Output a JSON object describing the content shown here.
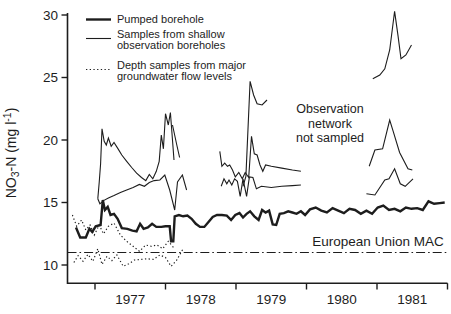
{
  "figure": {
    "background": "#ffffff",
    "ink_color": "#1d1d1d"
  },
  "legend": {
    "items": [
      {
        "style": "thick-solid",
        "label_lines": [
          "Pumped borehole"
        ]
      },
      {
        "style": "thin-solid",
        "label_lines": [
          "Samples from shallow",
          "observation boreholes"
        ]
      },
      {
        "style": "dotted",
        "label_lines": [
          "Depth samples from major",
          "groundwater flow levels"
        ]
      }
    ]
  },
  "chart_data": {
    "type": "line",
    "title": "",
    "xlabel": "",
    "ylabel": "NO3-N (mg l-1)",
    "ylabel_parts": {
      "base": "NO",
      "sub": "3",
      "mid": "-N  (mg l",
      "sup": "-1",
      "close": ")"
    },
    "grid": false,
    "legend_position": "top-left",
    "x_axis_range": [
      1976.6,
      1982.0
    ],
    "x_tick_years": [
      1977,
      1978,
      1979,
      1980,
      1981
    ],
    "ylim": [
      8.5,
      30.4
    ],
    "yticks": [
      10,
      15,
      20,
      25,
      30
    ],
    "annotations": {
      "observation_gap": {
        "lines": [
          "Observation",
          "network",
          "not sampled"
        ]
      },
      "mac": {
        "label": "European Union MAC",
        "value": 11.0
      }
    },
    "series": [
      {
        "name": "Pumped borehole",
        "style": "thick",
        "segments": [
          [
            [
              1976.73,
              13.0
            ],
            [
              1976.79,
              12.2
            ],
            [
              1976.87,
              12.2
            ],
            [
              1976.92,
              12.9
            ],
            [
              1976.96,
              12.65
            ],
            [
              1977.01,
              13.1
            ],
            [
              1977.08,
              13.2
            ],
            [
              1977.11,
              15.2
            ],
            [
              1977.14,
              14.4
            ],
            [
              1977.18,
              14.65
            ],
            [
              1977.22,
              14.0
            ],
            [
              1977.27,
              14.1
            ],
            [
              1977.32,
              13.7
            ],
            [
              1977.38,
              12.95
            ],
            [
              1977.46,
              12.9
            ],
            [
              1977.53,
              12.75
            ],
            [
              1977.59,
              12.7
            ],
            [
              1977.64,
              13.3
            ],
            [
              1977.69,
              12.9
            ],
            [
              1977.75,
              13.0
            ],
            [
              1977.81,
              13.3
            ],
            [
              1977.87,
              13.05
            ],
            [
              1977.94,
              13.05
            ],
            [
              1978.0,
              13.1
            ],
            [
              1978.06,
              13.1
            ],
            [
              1978.08,
              11.9
            ],
            [
              1978.11,
              11.9
            ],
            [
              1978.13,
              13.9
            ],
            [
              1978.19,
              14.0
            ],
            [
              1978.25,
              13.9
            ],
            [
              1978.31,
              13.95
            ],
            [
              1978.37,
              13.7
            ],
            [
              1978.43,
              13.3
            ],
            [
              1978.49,
              13.05
            ],
            [
              1978.55,
              13.05
            ],
            [
              1978.61,
              13.45
            ],
            [
              1978.67,
              13.85
            ],
            [
              1978.73,
              14.0
            ],
            [
              1978.8,
              14.0
            ],
            [
              1978.87,
              13.95
            ],
            [
              1978.93,
              13.6
            ],
            [
              1978.99,
              14.0
            ],
            [
              1979.05,
              14.15
            ],
            [
              1979.1,
              13.8
            ],
            [
              1979.15,
              14.1
            ],
            [
              1979.2,
              14.3
            ],
            [
              1979.26,
              13.9
            ],
            [
              1979.32,
              13.6
            ],
            [
              1979.37,
              14.4
            ],
            [
              1979.42,
              14.2
            ],
            [
              1979.47,
              14.35
            ],
            [
              1979.52,
              13.25
            ],
            [
              1979.57,
              13.2
            ],
            [
              1979.62,
              14.1
            ],
            [
              1979.68,
              14.15
            ],
            [
              1979.74,
              14.3
            ],
            [
              1979.8,
              14.2
            ],
            [
              1979.86,
              14.1
            ],
            [
              1979.92,
              14.3
            ],
            [
              1979.98,
              14.0
            ],
            [
              1980.05,
              14.45
            ],
            [
              1980.13,
              14.6
            ],
            [
              1980.21,
              14.35
            ],
            [
              1980.29,
              14.2
            ],
            [
              1980.37,
              14.55
            ],
            [
              1980.45,
              14.35
            ],
            [
              1980.53,
              14.15
            ],
            [
              1980.61,
              14.5
            ],
            [
              1980.69,
              14.4
            ],
            [
              1980.77,
              14.1
            ],
            [
              1980.85,
              14.35
            ],
            [
              1980.93,
              14.1
            ],
            [
              1981.01,
              14.6
            ],
            [
              1981.09,
              14.75
            ],
            [
              1981.17,
              14.4
            ],
            [
              1981.25,
              14.5
            ],
            [
              1981.33,
              14.3
            ],
            [
              1981.41,
              14.6
            ],
            [
              1981.49,
              14.5
            ],
            [
              1981.57,
              14.55
            ],
            [
              1981.65,
              14.4
            ],
            [
              1981.73,
              15.1
            ],
            [
              1981.81,
              14.9
            ],
            [
              1981.89,
              14.95
            ],
            [
              1981.96,
              15.0
            ]
          ]
        ]
      },
      {
        "name": "Samples from shallow observation boreholes",
        "style": "thin",
        "segments": [
          [
            [
              1977.04,
              15.3
            ],
            [
              1977.06,
              16.6
            ],
            [
              1977.08,
              18.1
            ],
            [
              1977.1,
              20.9
            ],
            [
              1977.13,
              19.9
            ],
            [
              1977.16,
              19.6
            ],
            [
              1977.19,
              20.15
            ],
            [
              1977.23,
              19.5
            ],
            [
              1977.27,
              19.8
            ],
            [
              1977.32,
              19.35
            ],
            [
              1977.38,
              18.8
            ],
            [
              1977.45,
              18.3
            ],
            [
              1977.52,
              17.8
            ],
            [
              1977.59,
              17.35
            ],
            [
              1977.66,
              17.0
            ],
            [
              1977.72,
              16.75
            ],
            [
              1977.77,
              17.25
            ],
            [
              1977.82,
              16.9
            ],
            [
              1977.87,
              17.5
            ],
            [
              1977.91,
              18.3
            ],
            [
              1977.94,
              20.4
            ],
            [
              1977.97,
              19.3
            ],
            [
              1978.0,
              22.1
            ],
            [
              1978.04,
              21.2
            ],
            [
              1978.07,
              22.2
            ],
            [
              1978.12,
              18.4
            ]
          ],
          [
            [
              1977.04,
              15.3
            ],
            [
              1977.07,
              14.9
            ],
            [
              1977.12,
              15.15
            ],
            [
              1977.19,
              15.35
            ],
            [
              1977.27,
              15.55
            ],
            [
              1977.36,
              15.8
            ],
            [
              1977.45,
              16.0
            ],
            [
              1977.54,
              16.2
            ],
            [
              1977.63,
              16.45
            ],
            [
              1977.7,
              16.3
            ],
            [
              1977.77,
              16.6
            ],
            [
              1977.84,
              16.75
            ],
            [
              1977.92,
              16.8
            ],
            [
              1977.99,
              17.2
            ],
            [
              1978.06,
              16.0
            ],
            [
              1978.13,
              14.4
            ],
            [
              1978.17,
              16.65
            ],
            [
              1978.24,
              17.2
            ],
            [
              1978.3,
              16.0
            ]
          ],
          [
            [
              1978.1,
              21.2
            ],
            [
              1978.16,
              19.6
            ],
            [
              1978.2,
              18.6
            ]
          ],
          [
            [
              1979.1,
              16.3
            ],
            [
              1979.14,
              17.1
            ],
            [
              1979.2,
              24.7
            ],
            [
              1979.25,
              23.6
            ],
            [
              1979.3,
              22.9
            ],
            [
              1979.37,
              22.8
            ],
            [
              1979.44,
              23.2
            ]
          ],
          [
            [
              1978.77,
              19.1
            ],
            [
              1978.8,
              17.9
            ],
            [
              1978.84,
              18.15
            ],
            [
              1978.88,
              17.9
            ],
            [
              1978.91,
              18.0
            ],
            [
              1978.95,
              17.6
            ],
            [
              1978.99,
              17.05
            ],
            [
              1979.04,
              17.4
            ],
            [
              1979.09,
              16.9
            ],
            [
              1979.13,
              17.4
            ],
            [
              1979.18,
              17.0
            ],
            [
              1979.22,
              20.3
            ],
            [
              1979.26,
              18.9
            ],
            [
              1979.3,
              18.8
            ],
            [
              1979.34,
              18.0
            ],
            [
              1979.38,
              17.5
            ],
            [
              1979.42,
              18.0
            ],
            [
              1979.5,
              17.9
            ],
            [
              1979.65,
              17.75
            ],
            [
              1979.8,
              17.6
            ],
            [
              1979.92,
              17.5
            ]
          ],
          [
            [
              1978.79,
              16.3
            ],
            [
              1978.83,
              16.9
            ],
            [
              1978.87,
              16.5
            ],
            [
              1978.9,
              16.8
            ],
            [
              1978.94,
              16.4
            ],
            [
              1978.98,
              16.9
            ],
            [
              1979.02,
              16.7
            ],
            [
              1979.06,
              15.5
            ],
            [
              1979.1,
              16.9
            ],
            [
              1979.15,
              15.5
            ],
            [
              1979.19,
              17.05
            ],
            [
              1979.24,
              17.0
            ],
            [
              1979.29,
              16.1
            ],
            [
              1979.36,
              16.3
            ],
            [
              1979.5,
              16.2
            ],
            [
              1979.65,
              16.3
            ],
            [
              1979.8,
              16.35
            ],
            [
              1979.92,
              16.4
            ]
          ],
          [
            [
              1980.94,
              24.9
            ],
            [
              1981.04,
              25.2
            ],
            [
              1981.11,
              25.7
            ],
            [
              1981.18,
              27.2
            ],
            [
              1981.25,
              30.3
            ],
            [
              1981.3,
              28.3
            ],
            [
              1981.34,
              26.5
            ],
            [
              1981.41,
              26.8
            ],
            [
              1981.49,
              27.6
            ]
          ],
          [
            [
              1980.89,
              17.9
            ],
            [
              1980.97,
              19.2
            ],
            [
              1981.08,
              19.3
            ],
            [
              1981.18,
              21.6
            ],
            [
              1981.23,
              20.7
            ],
            [
              1981.32,
              19.0
            ],
            [
              1981.44,
              17.7
            ],
            [
              1981.5,
              17.6
            ]
          ],
          [
            [
              1980.85,
              15.7
            ],
            [
              1980.97,
              15.6
            ],
            [
              1981.11,
              16.8
            ],
            [
              1981.17,
              16.9
            ],
            [
              1981.25,
              17.7
            ],
            [
              1981.33,
              16.5
            ],
            [
              1981.4,
              16.3
            ],
            [
              1981.51,
              16.9
            ]
          ]
        ]
      },
      {
        "name": "Depth samples from major groundwater flow levels",
        "style": "dotted",
        "segments": [
          [
            [
              1976.68,
              14.0
            ],
            [
              1976.74,
              13.1
            ],
            [
              1976.81,
              13.6
            ],
            [
              1976.87,
              12.8
            ],
            [
              1976.93,
              13.2
            ],
            [
              1976.99,
              12.4
            ],
            [
              1977.06,
              13.2
            ],
            [
              1977.12,
              12.5
            ],
            [
              1977.19,
              13.1
            ],
            [
              1977.27,
              13.35
            ],
            [
              1977.36,
              12.4
            ],
            [
              1977.45,
              11.9
            ],
            [
              1977.54,
              11.5
            ],
            [
              1977.63,
              11.1
            ],
            [
              1977.72,
              11.6
            ],
            [
              1977.8,
              11.5
            ],
            [
              1977.88,
              11.6
            ],
            [
              1977.96,
              11.3
            ],
            [
              1978.04,
              11.9
            ],
            [
              1978.13,
              11.3
            ]
          ],
          [
            [
              1976.7,
              10.2
            ],
            [
              1976.76,
              10.75
            ],
            [
              1976.83,
              10.3
            ],
            [
              1976.9,
              10.85
            ],
            [
              1976.97,
              10.3
            ],
            [
              1977.04,
              11.3
            ],
            [
              1977.1,
              10.05
            ],
            [
              1977.17,
              10.7
            ],
            [
              1977.24,
              10.35
            ],
            [
              1977.31,
              10.8
            ],
            [
              1977.4,
              9.9
            ],
            [
              1977.48,
              10.1
            ],
            [
              1977.56,
              10.4
            ],
            [
              1977.65,
              10.45
            ],
            [
              1977.74,
              10.5
            ],
            [
              1977.83,
              10.45
            ],
            [
              1977.92,
              10.8
            ],
            [
              1978.0,
              10.6
            ],
            [
              1978.08,
              9.9
            ],
            [
              1978.16,
              10.4
            ],
            [
              1978.25,
              11.3
            ]
          ]
        ]
      }
    ]
  }
}
